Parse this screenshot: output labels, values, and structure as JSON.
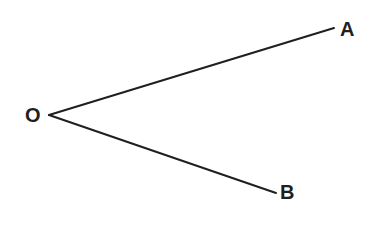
{
  "figure": {
    "canvas": {
      "width": 376,
      "height": 226,
      "background": "#ffffff"
    },
    "stroke": {
      "color": "#1f1f1f",
      "width": 2
    },
    "points": [
      {
        "id": "O",
        "label": "O",
        "x": 49,
        "y": 115,
        "role": "vertex",
        "label_x": 25,
        "label_y": 105
      },
      {
        "id": "A",
        "label": "A",
        "x": 334,
        "y": 28,
        "role": "ray-endpoint",
        "label_x": 340,
        "label_y": 19
      },
      {
        "id": "B",
        "label": "B",
        "x": 276,
        "y": 193,
        "role": "ray-endpoint",
        "label_x": 280,
        "label_y": 182
      }
    ],
    "segments": [
      {
        "id": "OA",
        "from": "O",
        "to": "A",
        "x1": 49,
        "y1": 115,
        "x2": 334,
        "y2": 28
      },
      {
        "id": "OB",
        "from": "O",
        "to": "B",
        "x1": 49,
        "y1": 115,
        "x2": 276,
        "y2": 193
      }
    ]
  }
}
